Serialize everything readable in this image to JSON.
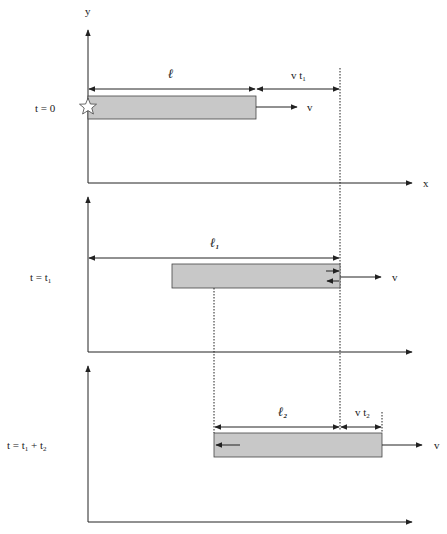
{
  "axes": {
    "y_label": "y",
    "x_label": "x"
  },
  "panels": [
    {
      "time_label": "t = 0",
      "length_label": "ℓ",
      "length_sub": "",
      "offset_label": "v t",
      "offset_sub": "1",
      "velocity_label": "v",
      "marker": "star-icon"
    },
    {
      "time_label": "t = t",
      "time_sub": "1",
      "length_label": "ℓ",
      "length_sub": "1",
      "velocity_label": "v"
    },
    {
      "time_label": "t = t",
      "time_sub": "1",
      "time_tail": " + t",
      "time_tail_sub": "2",
      "length_label": "ℓ",
      "length_sub": "2",
      "offset_label": "v t",
      "offset_sub": "2",
      "velocity_label": "v"
    }
  ],
  "colors": {
    "bar_fill": "#c8c8c8",
    "stroke": "#222222",
    "background": "#ffffff"
  }
}
